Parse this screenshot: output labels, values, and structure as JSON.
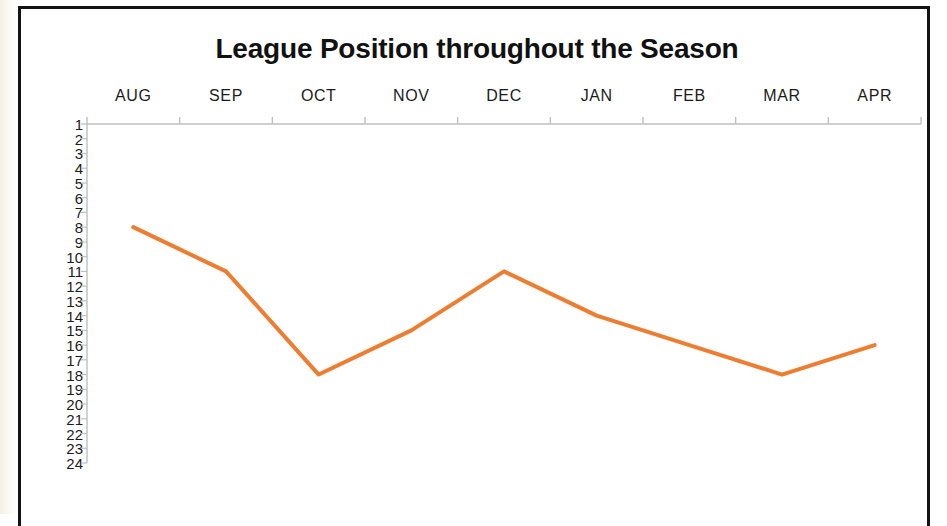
{
  "chart_data": {
    "type": "line",
    "title": "League Position throughout the Season",
    "xlabel": "",
    "ylabel": "",
    "categories": [
      "AUG",
      "SEP",
      "OCT",
      "NOV",
      "DEC",
      "JAN",
      "FEB",
      "MAR",
      "APR"
    ],
    "values": [
      8,
      11,
      18,
      15,
      11,
      14,
      16,
      18,
      16
    ],
    "series": [
      {
        "name": "League Position",
        "values": [
          8,
          11,
          18,
          15,
          11,
          14,
          16,
          18,
          16
        ]
      }
    ],
    "y_tick_labels": [
      "1",
      "2",
      "3",
      "4",
      "5",
      "6",
      "7",
      "8",
      "9",
      "10",
      "11",
      "12",
      "13",
      "14",
      "15",
      "16",
      "17",
      "18",
      "19",
      "20",
      "21",
      "22",
      "23",
      "24"
    ],
    "ylim": [
      1,
      24
    ],
    "y_axis_inverted": true,
    "grid": false,
    "legend": false,
    "legend_position": "none",
    "line_color": "#ED7D31",
    "axis_color": "#BFBFBF",
    "text_color": "#1B1B1B",
    "markers": false,
    "line_width": 4
  },
  "frame": {
    "border_color": "#131313"
  }
}
